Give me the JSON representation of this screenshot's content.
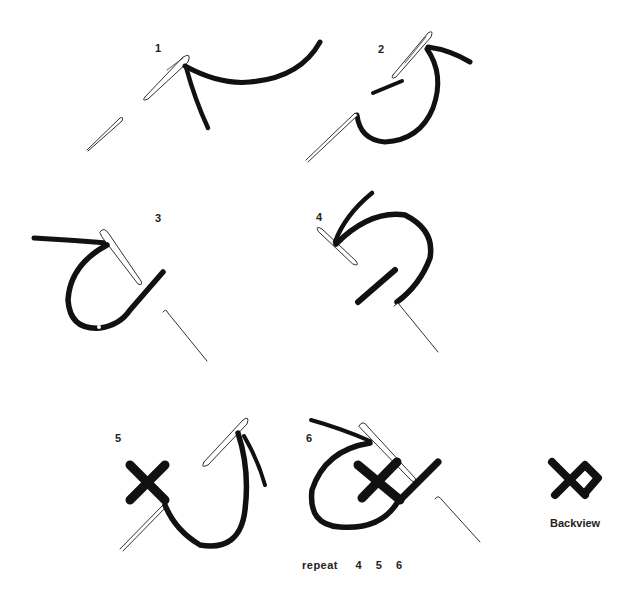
{
  "diagram": {
    "steps": [
      {
        "label": "1",
        "description": "Needle brought up, thread pulled through"
      },
      {
        "label": "2",
        "description": "Thread loops back, needle inserted diagonally"
      },
      {
        "label": "3",
        "description": "First diagonal stitch formed"
      },
      {
        "label": "4",
        "description": "Needle passes to start crossing stitch"
      },
      {
        "label": "5",
        "description": "Cross completed"
      },
      {
        "label": "6",
        "description": "Next stitch begins"
      }
    ],
    "repeat": {
      "word": "repeat",
      "numbers": [
        "4",
        "5",
        "6"
      ]
    },
    "backview_label": "Backview",
    "colors": {
      "thread": "#111111",
      "needle_outline": "#333333",
      "background": "#ffffff"
    }
  }
}
